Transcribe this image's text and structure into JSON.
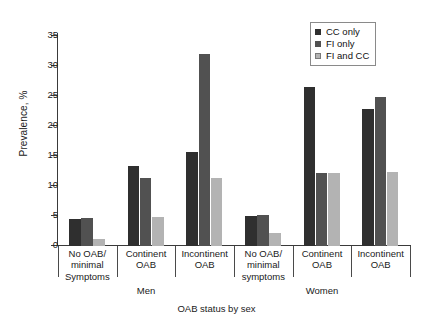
{
  "chart_data": {
    "type": "bar",
    "title": "",
    "xlabel": "OAB status by sex",
    "ylabel": "Prevalence, %",
    "ylim": [
      0,
      35
    ],
    "yticks": [
      0,
      5,
      10,
      15,
      20,
      25,
      30,
      35
    ],
    "grid": false,
    "legend_position": "top-right",
    "groups": [
      "Men",
      "Women"
    ],
    "categories": [
      {
        "group": "Men",
        "lines": [
          "No OAB/",
          "minimal",
          "Symptoms"
        ]
      },
      {
        "group": "Men",
        "lines": [
          "Continent",
          "OAB"
        ]
      },
      {
        "group": "Men",
        "lines": [
          "Incontinent",
          "OAB"
        ]
      },
      {
        "group": "Women",
        "lines": [
          "No OAB/",
          "minimal",
          "symptoms"
        ]
      },
      {
        "group": "Women",
        "lines": [
          "Continent",
          "OAB"
        ]
      },
      {
        "group": "Women",
        "lines": [
          "Incontinent",
          "OAB"
        ]
      }
    ],
    "series": [
      {
        "name": "CC only",
        "color": "#2f2f2f",
        "values": [
          4.5,
          13.3,
          15.6,
          5.0,
          26.5,
          22.8
        ]
      },
      {
        "name": "FI only",
        "color": "#515151",
        "values": [
          4.6,
          11.4,
          32.0,
          5.2,
          12.1,
          24.8
        ]
      },
      {
        "name": "FI and CC",
        "color": "#b3b3b3",
        "values": [
          1.1,
          4.8,
          11.4,
          2.1,
          12.2,
          12.3
        ]
      }
    ]
  },
  "legend": {
    "items": [
      {
        "label": "CC only"
      },
      {
        "label": "FI only"
      },
      {
        "label": "FI and CC"
      }
    ]
  },
  "axes": {
    "y_label": "Prevalence, %",
    "x_label": "OAB status by sex",
    "y_ticks": [
      "0",
      "5",
      "10",
      "15",
      "20",
      "25",
      "30",
      "35"
    ]
  },
  "group_labels": [
    "Men",
    "Women"
  ]
}
